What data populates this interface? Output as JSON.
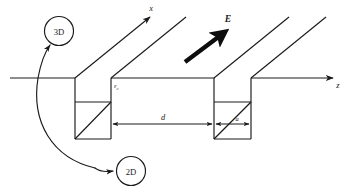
{
  "figure": {
    "background_color": "#ffffff",
    "line_color": "#1a1a1a",
    "width": 351,
    "height": 193
  },
  "axes": {
    "vertical_axis_label": "x",
    "horizontal_axis_label": "z"
  },
  "field": {
    "label": "E",
    "description": "applied electric field vector"
  },
  "energy_level": {
    "symbol": "ε",
    "subscript": "c",
    "label": "εc"
  },
  "dimensions": [
    {
      "name": "period",
      "label": "d"
    },
    {
      "name": "groove-width",
      "label": "a"
    }
  ],
  "callouts": [
    {
      "id": "callout-3d",
      "label": "3D"
    },
    {
      "id": "callout-2d",
      "label": "2D"
    }
  ],
  "icons": {
    "arrow_head": "arrowhead-icon",
    "curve_pointer": "curved-arrow-icon"
  }
}
